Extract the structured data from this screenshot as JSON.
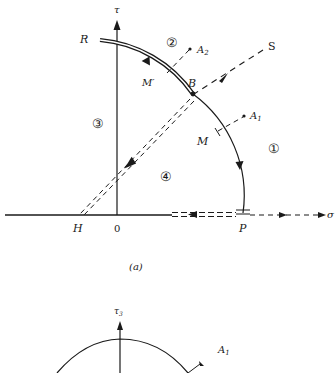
{
  "figure_a": {
    "axes": {
      "vertical_label": "τ",
      "horizontal_label": "σ",
      "origin_label": "0"
    },
    "points": {
      "R": "R",
      "B": "B",
      "M": "M",
      "M_prime": "M′",
      "H": "H",
      "P": "P",
      "S": "S",
      "A1": "A",
      "A1_sub": "1",
      "A2": "A",
      "A2_sub": "2"
    },
    "regions": [
      "①",
      "②",
      "③",
      "④"
    ],
    "caption": "(a)"
  },
  "figure_b": {
    "axes": {
      "vertical_label": "τ",
      "vertical_sub": "3"
    },
    "points": {
      "A1": "A",
      "A1_sub": "1"
    }
  }
}
